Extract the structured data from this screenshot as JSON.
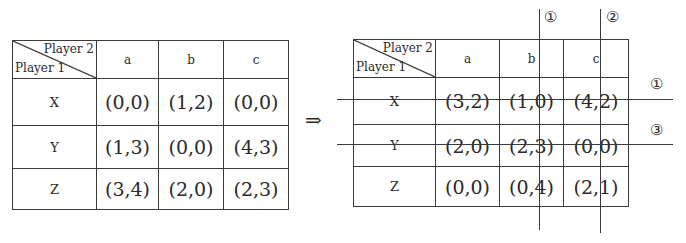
{
  "left_table": {
    "player2_label": "Player 2",
    "player1_label": "Player 1",
    "columns": [
      "a",
      "b",
      "c"
    ],
    "rows": [
      {
        "label": "X",
        "cells": [
          "(0,0)",
          "(1,2)",
          "(0,0)"
        ]
      },
      {
        "label": "Y",
        "cells": [
          "(1,3)",
          "(0,0)",
          "(4,3)"
        ]
      },
      {
        "label": "Z",
        "cells": [
          "(3,4)",
          "(2,0)",
          "(2,3)"
        ]
      }
    ]
  },
  "arrow": "⇒",
  "right_table": {
    "player2_label": "Player 2",
    "player1_label": "Player 1",
    "columns": [
      "a",
      "b",
      "c"
    ],
    "rows": [
      {
        "label": "X",
        "cells": [
          "(3,2)",
          "(1,0)",
          "(4,2)"
        ]
      },
      {
        "label": "Y",
        "cells": [
          "(2,0)",
          "(2,3)",
          "(0,0)"
        ]
      },
      {
        "label": "Z",
        "cells": [
          "(0,0)",
          "(0,4)",
          "(2,1)"
        ]
      }
    ]
  },
  "eliminations": {
    "column_b_order": "①",
    "column_c_order": "②",
    "row_x_order": "①",
    "row_y_order": "③"
  }
}
